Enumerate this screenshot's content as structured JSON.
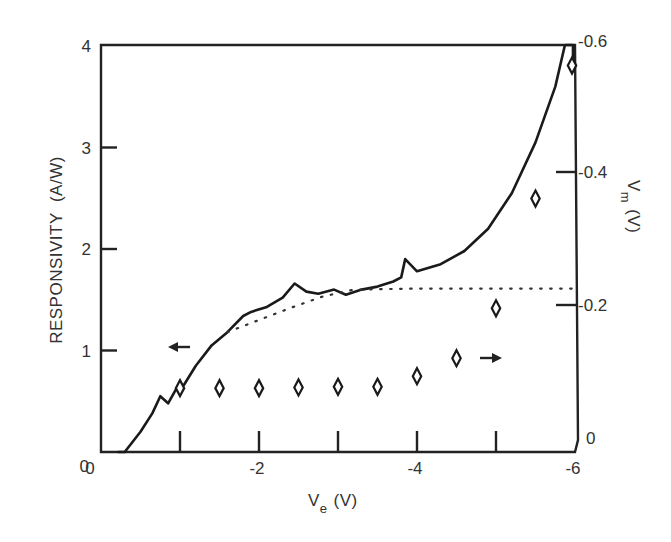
{
  "chart_data": {
    "type": "line",
    "title": "",
    "xlabel": "V_e (V)",
    "xlabel_main": "V",
    "xlabel_sub": "e",
    "xlabel_unit": "(V)",
    "ylabel": "RESPONSIVITY  (A/W)",
    "y2label": "V_m (V)",
    "y2label_main": "V",
    "y2label_sub": "m",
    "y2label_unit": "(V)",
    "xlim": [
      0,
      -6
    ],
    "ylim": [
      0,
      4
    ],
    "y2lim": [
      0,
      -0.6
    ],
    "x_tick_labels": [
      "0",
      "-2",
      "-4",
      "-6"
    ],
    "x_ticks": [
      -1,
      -2,
      -3,
      -4,
      -5
    ],
    "y_tick_labels": [
      "0",
      "1",
      "2",
      "3",
      "4"
    ],
    "y2_tick_labels": [
      "0",
      "-0.2",
      "-0.4",
      "-0.6"
    ],
    "grid": false,
    "series": [
      {
        "name": "Responsivity (measured)",
        "axis": "left",
        "style": "solid",
        "x": [
          -0.3,
          -0.5,
          -0.65,
          -0.75,
          -0.85,
          -0.95,
          -1.05,
          -1.2,
          -1.4,
          -1.6,
          -1.8,
          -1.9,
          -2.1,
          -2.3,
          -2.45,
          -2.6,
          -2.75,
          -2.95,
          -3.1,
          -3.3,
          -3.5,
          -3.7,
          -3.8,
          -3.85,
          -4.0,
          -4.3,
          -4.6,
          -4.9,
          -5.2,
          -5.5,
          -5.75,
          -5.87
        ],
        "values": [
          0.0,
          0.2,
          0.38,
          0.55,
          0.48,
          0.62,
          0.66,
          0.85,
          1.05,
          1.18,
          1.34,
          1.38,
          1.43,
          1.52,
          1.66,
          1.58,
          1.56,
          1.6,
          1.55,
          1.6,
          1.63,
          1.68,
          1.72,
          1.9,
          1.78,
          1.85,
          1.98,
          2.2,
          2.55,
          3.05,
          3.6,
          4.0
        ]
      },
      {
        "name": "Responsivity (extrapolated)",
        "axis": "left",
        "style": "dotted",
        "x": [
          -1.6,
          -2.0,
          -2.4,
          -2.8,
          -3.2,
          -4.0,
          -5.0,
          -6.0
        ],
        "values": [
          1.18,
          1.3,
          1.42,
          1.53,
          1.6,
          1.61,
          1.61,
          1.61
        ]
      },
      {
        "name": "V_m",
        "axis": "right",
        "style": "diamond markers",
        "x": [
          -1.0,
          -1.5,
          -2.0,
          -2.5,
          -3.0,
          -3.5,
          -4.0,
          -4.5,
          -5.0,
          -5.5,
          -6.0
        ],
        "values": [
          -0.075,
          -0.075,
          -0.075,
          -0.076,
          -0.077,
          -0.077,
          -0.093,
          -0.12,
          -0.195,
          -0.36,
          -0.56
        ]
      }
    ],
    "annotations": [
      {
        "text": "←",
        "meaning": "arrow pointing left: solid curve uses left axis",
        "at": {
          "x": -1.0,
          "y": 1.05
        }
      },
      {
        "text": "→",
        "meaning": "arrow pointing right: diamonds use right axis",
        "at": {
          "x": -4.9,
          "y2": -0.12
        }
      }
    ],
    "legend": "none"
  }
}
